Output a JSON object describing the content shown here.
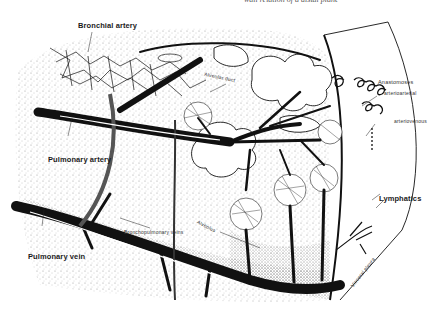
{
  "caption_top": "wall relation of a distal plane",
  "labels": {
    "bronchial_artery": "Bronchial artery",
    "alveolar_duct": "Alveolar duct",
    "anastomoses": "Anastomoses",
    "arterioarterial": "arterioarterial",
    "arteriovenous": "arteriovenous",
    "pulmonary_artery": "Pulmonary artery",
    "bronchopulmonary_veins": "Bronchopulmonary veins",
    "alveolus": "Alveolus",
    "lymphatics": "Lymphatics",
    "pulmonary_vein": "Pulmonary vein",
    "visceral_pleura": "Visceral pleura"
  },
  "colors": {
    "ink": "#111111",
    "stipple": "#9a9a9a",
    "background": "#ffffff"
  }
}
